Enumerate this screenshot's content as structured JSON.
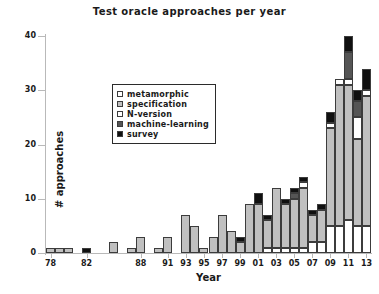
{
  "chart_data": {
    "type": "bar",
    "stacked": true,
    "title": "Test oracle approaches per year",
    "xlabel": "Year",
    "ylabel": "# approaches",
    "ylim": [
      0,
      40
    ],
    "yticks": [
      0,
      10,
      20,
      30,
      40
    ],
    "ytick_labels": [
      "0",
      "10",
      "20",
      "30",
      "40"
    ],
    "grid": false,
    "legend_position": "upper left",
    "categories": [
      "78",
      "79",
      "80",
      "81",
      "82",
      "83",
      "84",
      "85",
      "86",
      "87",
      "88",
      "89",
      "90",
      "91",
      "92",
      "93",
      "94",
      "95",
      "96",
      "97",
      "98",
      "99",
      "00",
      "01",
      "02",
      "03",
      "04",
      "05",
      "06",
      "07",
      "08",
      "09",
      "10",
      "11",
      "12",
      "13"
    ],
    "xtick_labels": [
      "78",
      "82",
      "88",
      "91",
      "93",
      "95",
      "97",
      "99",
      "01",
      "03",
      "05",
      "07",
      "09",
      "11",
      "13"
    ],
    "xtick_categories": [
      "78",
      "82",
      "88",
      "91",
      "93",
      "95",
      "97",
      "99",
      "01",
      "03",
      "05",
      "07",
      "09",
      "11",
      "13"
    ],
    "series": [
      {
        "name": "metamorphic",
        "color": "#ffffff",
        "values": [
          0,
          0,
          0,
          0,
          0,
          0,
          0,
          0,
          0,
          0,
          0,
          0,
          0,
          0,
          0,
          0,
          0,
          0,
          0,
          0,
          0,
          0,
          0,
          0,
          1,
          1,
          1,
          1,
          1,
          2,
          2,
          5,
          5,
          6,
          5,
          5
        ]
      },
      {
        "name": "specification",
        "color": "#c0c0c0",
        "values": [
          1,
          1,
          1,
          0,
          0,
          0,
          0,
          2,
          0,
          1,
          3,
          0,
          1,
          3,
          0,
          7,
          5,
          1,
          3,
          7,
          4,
          2,
          9,
          9,
          5,
          11,
          8,
          9,
          11,
          5,
          6,
          18,
          26,
          25,
          16,
          24
        ]
      },
      {
        "name": "N-version",
        "color": "#ffffff",
        "values": [
          0,
          0,
          0,
          0,
          0,
          0,
          0,
          0,
          0,
          0,
          0,
          0,
          0,
          0,
          0,
          0,
          0,
          0,
          0,
          0,
          0,
          0,
          0,
          0,
          0,
          0,
          0,
          0,
          1,
          0,
          0,
          1,
          1,
          1,
          4,
          1
        ]
      },
      {
        "name": "machine-learning",
        "color": "#555555",
        "values": [
          0,
          0,
          0,
          0,
          0,
          0,
          0,
          0,
          0,
          0,
          0,
          0,
          0,
          0,
          0,
          0,
          0,
          0,
          0,
          0,
          0,
          0,
          0,
          0,
          0,
          0,
          0,
          1,
          0,
          0,
          0,
          0,
          0,
          5,
          3,
          0
        ]
      },
      {
        "name": "survey",
        "color": "#101010",
        "values": [
          0,
          0,
          0,
          0,
          1,
          0,
          0,
          0,
          0,
          0,
          0,
          0,
          0,
          0,
          0,
          0,
          0,
          0,
          0,
          0,
          0,
          1,
          0,
          2,
          1,
          0,
          1,
          1,
          1,
          1,
          1,
          2,
          0,
          3,
          2,
          4
        ]
      }
    ],
    "totals": [
      1,
      1,
      1,
      0,
      1,
      0,
      0,
      2,
      0,
      1,
      3,
      0,
      1,
      3,
      0,
      7,
      5,
      1,
      3,
      7,
      4,
      3,
      9,
      11,
      7,
      12,
      10,
      12,
      14,
      8,
      9,
      26,
      32,
      40,
      30,
      34
    ]
  },
  "legend": {
    "items": [
      {
        "label": "metamorphic",
        "swatch": "#ffffff"
      },
      {
        "label": "specification",
        "swatch": "#c0c0c0"
      },
      {
        "label": "N-version",
        "swatch": "#ffffff"
      },
      {
        "label": "machine-learning",
        "swatch": "#555555"
      },
      {
        "label": "survey",
        "swatch": "#101010"
      }
    ]
  }
}
